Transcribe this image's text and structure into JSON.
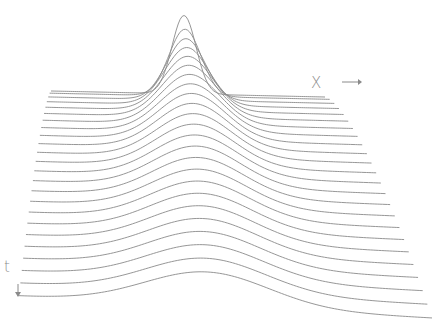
{
  "chart_data": {
    "type": "line",
    "subtype": "waterfall",
    "title": "",
    "xlabel": "X",
    "ylabel": "t",
    "grid": false,
    "legend": null,
    "num_curves": 24,
    "curve_color": "#8a8a8a",
    "back": {
      "x_left": 51,
      "x_right": 325,
      "y_base_left": 91,
      "y_base_right": 97,
      "peak_x": 184,
      "peak_height": 79,
      "width": 12
    },
    "front": {
      "x_left": 19,
      "x_right": 432,
      "y_base_left": 296,
      "y_base_right": 318,
      "peak_x": 207,
      "peak_height": 30,
      "width": 62
    },
    "series": [
      {
        "name": "t0",
        "relative_peak": 1.0
      },
      {
        "name": "t_last",
        "relative_peak": 0.38
      }
    ]
  },
  "axes": {
    "x_label": "X",
    "x_arrow": "right-arrow",
    "t_label": "t",
    "t_arrow": "down-arrow"
  }
}
